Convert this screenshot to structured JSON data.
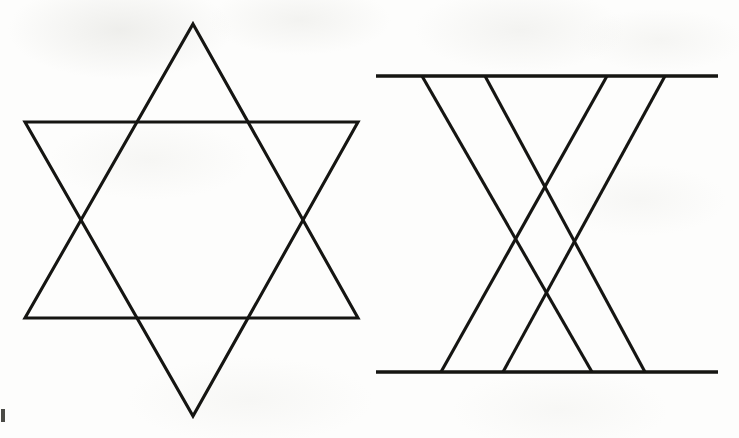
{
  "document": {
    "title": "Two line-drawing geometric figures",
    "background_color": "#fdfdfc",
    "ink_color": "#151512",
    "width": 739,
    "height": 438
  },
  "figures": [
    {
      "id": "hexagram",
      "name": "Star of David (hexagram)",
      "description": "Two overlapping equilateral triangles forming a six-pointed star",
      "stroke_color": "#151512",
      "stroke_width": 3.1,
      "triangles": [
        {
          "name": "upward-triangle",
          "points": [
            [
              193,
              24
            ],
            [
              358,
              318
            ],
            [
              25,
              318
            ]
          ]
        },
        {
          "name": "downward-triangle",
          "points": [
            [
              25,
              122
            ],
            [
              358,
              122
            ],
            [
              193,
              416
            ]
          ]
        }
      ],
      "vertices": {
        "top_apex": [
          193,
          24
        ],
        "bottom_apex": [
          193,
          416
        ],
        "upper_left": [
          25,
          122
        ],
        "upper_right": [
          358,
          122
        ],
        "lower_left": [
          25,
          318
        ],
        "lower_right": [
          358,
          318
        ]
      },
      "crossings": [
        [
          80,
          222
        ],
        [
          306,
          222
        ],
        [
          117,
          122
        ],
        [
          269,
          122
        ],
        [
          117,
          318
        ],
        [
          269,
          318
        ]
      ]
    },
    {
      "id": "crossed-rails",
      "name": "Crossed transversals between two parallel rails",
      "description": "Two horizontal parallel lines joined by four slanted lines that cross in the middle",
      "stroke_color": "#151512",
      "stroke_width": 3.4,
      "rails": [
        {
          "name": "top-rail",
          "x1": 376,
          "y1": 76,
          "x2": 718,
          "y2": 76
        },
        {
          "name": "bottom-rail",
          "x1": 376,
          "y1": 372,
          "x2": 718,
          "y2": 372
        }
      ],
      "transversals": [
        {
          "name": "transversal-1",
          "x1": 422,
          "y1": 76,
          "x2": 592,
          "y2": 372,
          "direction": "down-right"
        },
        {
          "name": "transversal-2",
          "x1": 485,
          "y1": 76,
          "x2": 645,
          "y2": 372,
          "direction": "down-right"
        },
        {
          "name": "transversal-3",
          "x1": 607,
          "y1": 76,
          "x2": 441,
          "y2": 372,
          "direction": "down-left"
        },
        {
          "name": "transversal-4",
          "x1": 665,
          "y1": 76,
          "x2": 503,
          "y2": 372,
          "direction": "down-left"
        }
      ]
    }
  ],
  "artifacts": [
    {
      "name": "left-edge-scan-mark",
      "x": 1,
      "y": 409,
      "width": 4,
      "height": 13
    }
  ]
}
